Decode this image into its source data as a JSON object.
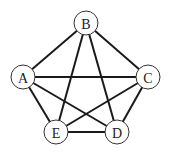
{
  "graph": {
    "type": "complete graph",
    "nodes": [
      {
        "id": "A",
        "label": "A",
        "x": 23,
        "y": 77
      },
      {
        "id": "B",
        "label": "B",
        "x": 86,
        "y": 23
      },
      {
        "id": "C",
        "label": "C",
        "x": 148,
        "y": 77
      },
      {
        "id": "D",
        "label": "D",
        "x": 117,
        "y": 132
      },
      {
        "id": "E",
        "label": "E",
        "x": 56,
        "y": 132
      }
    ],
    "edges": [
      [
        "A",
        "B"
      ],
      [
        "B",
        "C"
      ],
      [
        "A",
        "C"
      ],
      [
        "A",
        "E"
      ],
      [
        "A",
        "D"
      ],
      [
        "B",
        "E"
      ],
      [
        "B",
        "D"
      ],
      [
        "C",
        "E"
      ],
      [
        "C",
        "D"
      ],
      [
        "E",
        "D"
      ]
    ],
    "node_radius": 12
  }
}
